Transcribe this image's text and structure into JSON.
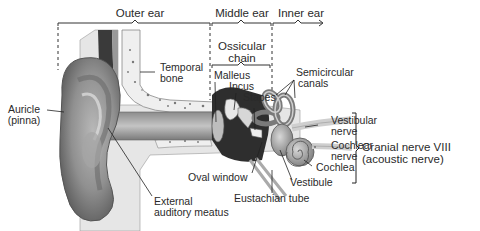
{
  "diagram": {
    "type": "anatomical-illustration",
    "regions": [
      {
        "id": "outer",
        "label": "Outer ear"
      },
      {
        "id": "middle",
        "label": "Middle ear"
      },
      {
        "id": "inner",
        "label": "Inner ear"
      }
    ],
    "group_labels": {
      "ossicular": "Ossicular chain",
      "ossicular_line1": "Ossicular",
      "ossicular_line2": "chain",
      "cranial_line1": "Cranial nerve VIII",
      "cranial_line2": "(acoustic nerve)"
    },
    "labels": {
      "auricle_line1": "Auricle",
      "auricle_line2": "(pinna)",
      "temporal_line1": "Temporal",
      "temporal_line2": "bone",
      "malleus": "Malleus",
      "incus": "Incus",
      "stapes": "Stapes",
      "semicircular_line1": "Semicircular",
      "semicircular_line2": "canals",
      "vestibular_line1": "Vestibular",
      "vestibular_line2": "nerve",
      "cochlear_line1": "Cochlear",
      "cochlear_line2": "nerve",
      "cochlea": "Cochlea",
      "vestibule": "Vestibule",
      "oval_window": "Oval window",
      "eustachian": "Eustachian tube",
      "external_line1": "External",
      "external_line2": "auditory meatus"
    }
  }
}
